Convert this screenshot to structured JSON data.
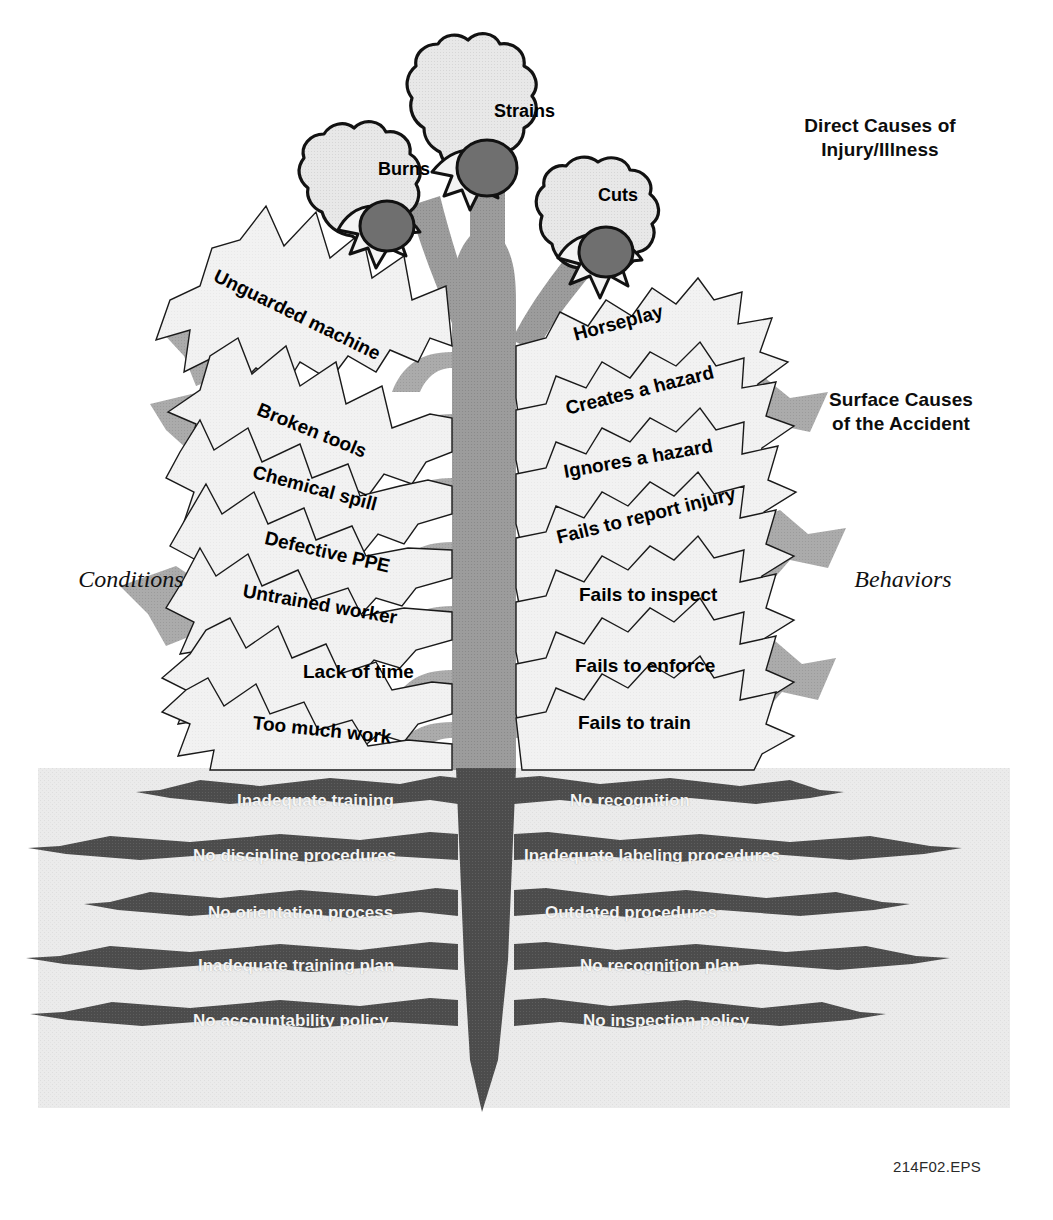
{
  "figure": {
    "code": "214F02.EPS",
    "colors": {
      "background": "#ffffff",
      "soil": "#ebebeb",
      "trunk": "#9a9a9a",
      "trunk_dark": "#545454",
      "leaf_fill": "#f1f1f1",
      "leaf_outline": "#1a1a1a",
      "leaf_shadow": "#a8a8a8",
      "root": "#4a4a4a",
      "flower_petal": "#e6e6e6",
      "flower_head": "#6f6f6f",
      "text_dark": "#0d0d0d",
      "text_light": "#f4f4f4"
    }
  },
  "headings": {
    "direct_causes": "Direct Causes of\nInjury/Illness",
    "surface_causes": "Surface Causes\nof the Accident"
  },
  "side_labels": {
    "left": "Conditions",
    "right": "Behaviors"
  },
  "flowers": [
    {
      "label": "Burns",
      "x": 378,
      "y": 159,
      "cx": 411,
      "cy": 140
    },
    {
      "label": "Strains",
      "x": 494,
      "y": 101,
      "cx": 536,
      "cy": 84
    },
    {
      "label": "Cuts",
      "x": 598,
      "y": 185,
      "cx": 629,
      "cy": 166
    }
  ],
  "leaves_left": [
    {
      "label": "Unguarded machine",
      "x": 215,
      "y": 264,
      "rot": 26,
      "size": 19
    },
    {
      "label": "Broken tools",
      "x": 258,
      "y": 398,
      "rot": 22,
      "size": 19
    },
    {
      "label": "Chemical spill",
      "x": 253,
      "y": 461,
      "rot": 15,
      "size": 19
    },
    {
      "label": "Defective  PPE",
      "x": 265,
      "y": 527,
      "rot": 13,
      "size": 19
    },
    {
      "label": "Untrained worker",
      "x": 243,
      "y": 580,
      "rot": 10,
      "size": 19
    },
    {
      "label": "Lack of time",
      "x": 303,
      "y": 661,
      "rot": 0,
      "size": 19
    },
    {
      "label": "Too much work",
      "x": 253,
      "y": 712,
      "rot": 6,
      "size": 19
    }
  ],
  "leaves_right": [
    {
      "label": "Horseplay",
      "x": 574,
      "y": 324,
      "rot": -15,
      "size": 19
    },
    {
      "label": "Creates a hazard",
      "x": 566,
      "y": 398,
      "rot": -14,
      "size": 19
    },
    {
      "label": "Ignores a hazard",
      "x": 564,
      "y": 461,
      "rot": -10,
      "size": 19
    },
    {
      "label": "Fails to report injury",
      "x": 557,
      "y": 527,
      "rot": -14,
      "size": 19
    },
    {
      "label": "Fails to inspect",
      "x": 579,
      "y": 584,
      "rot": 0,
      "size": 19
    },
    {
      "label": "Fails to enforce",
      "x": 575,
      "y": 655,
      "rot": 0,
      "size": 19
    },
    {
      "label": "Fails to train",
      "x": 578,
      "y": 712,
      "rot": 0,
      "size": 19
    }
  ],
  "roots_left": [
    {
      "label": "Inadequate training",
      "x": 237,
      "y": 791,
      "size": 17
    },
    {
      "label": "No discipline procedures",
      "x": 193,
      "y": 846,
      "size": 17
    },
    {
      "label": "No orientation process",
      "x": 208,
      "y": 903,
      "size": 17
    },
    {
      "label": "Inadequate training plan",
      "x": 198,
      "y": 956,
      "size": 17
    },
    {
      "label": "No accountability policy",
      "x": 193,
      "y": 1011,
      "size": 17
    }
  ],
  "roots_right": [
    {
      "label": "No recognition",
      "x": 570,
      "y": 791,
      "size": 17
    },
    {
      "label": "Inadequate labeling procedures",
      "x": 524,
      "y": 846,
      "size": 17
    },
    {
      "label": "Outdated  procedures",
      "x": 545,
      "y": 903,
      "size": 17
    },
    {
      "label": "No recognition plan",
      "x": 580,
      "y": 956,
      "size": 17
    },
    {
      "label": "No inspection policy",
      "x": 583,
      "y": 1011,
      "size": 17
    }
  ],
  "chart_data": {
    "type": "diagram",
    "levels": [
      {
        "name": "Direct Causes of Injury/Illness",
        "zone": "flowers",
        "items": [
          "Burns",
          "Strains",
          "Cuts"
        ]
      },
      {
        "name": "Surface Causes of the Accident",
        "zone": "leaves-left",
        "group": "Conditions",
        "items": [
          "Unguarded machine",
          "Broken tools",
          "Chemical spill",
          "Defective  PPE",
          "Untrained worker",
          "Lack of time",
          "Too much work"
        ]
      },
      {
        "name": "Surface Causes of the Accident",
        "zone": "leaves-right",
        "group": "Behaviors",
        "items": [
          "Horseplay",
          "Creates a hazard",
          "Ignores a hazard",
          "Fails to report injury",
          "Fails to inspect",
          "Fails to enforce",
          "Fails to train"
        ]
      },
      {
        "name": "Root Causes",
        "zone": "roots-left",
        "items": [
          "Inadequate training",
          "No discipline procedures",
          "No orientation process",
          "Inadequate training plan",
          "No accountability policy"
        ]
      },
      {
        "name": "Root Causes",
        "zone": "roots-right",
        "items": [
          "No recognition",
          "Inadequate labeling procedures",
          "Outdated  procedures",
          "No recognition plan",
          "No inspection policy"
        ]
      }
    ]
  }
}
